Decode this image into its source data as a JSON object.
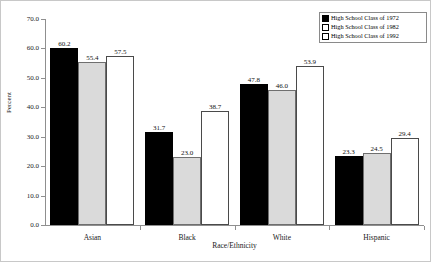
{
  "chart_data": {
    "type": "bar",
    "title": "",
    "xlabel": "Race/Ethnicity",
    "ylabel": "Percent",
    "categories": [
      "Asian",
      "Black",
      "White",
      "Hispanic"
    ],
    "series": [
      {
        "name": "High School Class of 1972",
        "values": [
          60.2,
          31.7,
          47.8,
          23.3
        ],
        "color": "#000000",
        "swatch": "filled-black"
      },
      {
        "name": "High School Class of 1982",
        "values": [
          55.4,
          23.0,
          46.0,
          24.5
        ],
        "color": "#dadada",
        "swatch": "light-gray"
      },
      {
        "name": "High School Class of 1992",
        "values": [
          57.5,
          38.7,
          53.9,
          29.4
        ],
        "color": "#ffffff",
        "swatch": "white"
      }
    ],
    "ylim": [
      0.0,
      70.0
    ],
    "yticks": [
      0.0,
      10.0,
      20.0,
      30.0,
      40.0,
      50.0,
      60.0,
      70.0
    ],
    "ytick_labels": [
      "0.0",
      "10.0",
      "20.0",
      "30.0",
      "40.0",
      "50.0",
      "60.0",
      "70.0"
    ],
    "grid": false,
    "legend_position": "top-right",
    "data_labels": true,
    "data_label_format": "one-decimal",
    "value_labels": {
      "Asian": [
        "60.2",
        "55.4",
        "57.5"
      ],
      "Black": [
        "31.7",
        "23.0",
        "38.7"
      ],
      "White": [
        "47.8",
        "46.0",
        "53.9"
      ],
      "Hispanic": [
        "23.3",
        "24.5",
        "29.4"
      ]
    }
  },
  "legend": {
    "items": [
      {
        "label": "High School Class of 1972"
      },
      {
        "label": "High School Class of 1982"
      },
      {
        "label": "High School Class of 1992"
      }
    ]
  },
  "axes": {
    "y_title": "Percent",
    "x_title": "Race/Ethnicity"
  }
}
